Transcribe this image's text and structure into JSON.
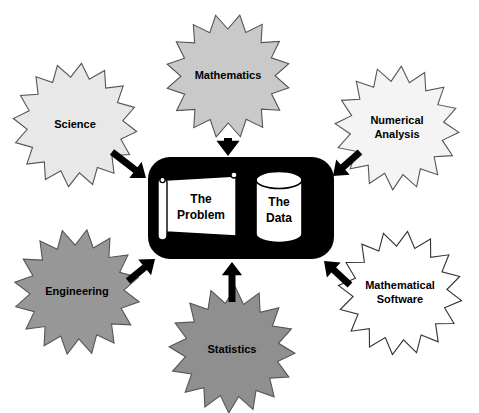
{
  "diagram": {
    "type": "hub-and-spoke",
    "canvas": {
      "width": 479,
      "height": 413,
      "background": "#ffffff"
    },
    "core": {
      "name": "central-container",
      "shape": "rounded-rectangle",
      "fill": "#000000",
      "x": 148,
      "y": 157,
      "width": 186,
      "height": 102,
      "radius": 22,
      "nodes": [
        {
          "id": "problem",
          "label_lines": [
            "The",
            "Problem"
          ],
          "shape": "scroll-banner",
          "fill": "#ffffff",
          "stroke": "#000000"
        },
        {
          "id": "data",
          "label_lines": [
            "The",
            "Data"
          ],
          "shape": "cylinder",
          "fill": "#ffffff",
          "stroke": "#000000"
        }
      ]
    },
    "bursts": [
      {
        "id": "science",
        "label_lines": [
          "Science"
        ],
        "fill": "#e8e8e8",
        "stroke": "#555555",
        "cx": 75,
        "cy": 125,
        "r_outer": 62,
        "r_inner": 48,
        "points": 16,
        "rotation": 6
      },
      {
        "id": "mathematics",
        "label_lines": [
          "Mathematics"
        ],
        "fill": "#c9c9c9",
        "stroke": "#555555",
        "cx": 228,
        "cy": 76,
        "r_outer": 62,
        "r_inner": 47,
        "points": 16,
        "rotation": 11
      },
      {
        "id": "numerical-analysis",
        "label_lines": [
          "Numerical",
          "Analysis"
        ],
        "fill": "#f4f4f4",
        "stroke": "#555555",
        "cx": 397,
        "cy": 128,
        "r_outer": 62,
        "r_inner": 47,
        "points": 16,
        "rotation": 4
      },
      {
        "id": "engineering",
        "label_lines": [
          "Engineering"
        ],
        "fill": "#979797",
        "stroke": "#555555",
        "cx": 77,
        "cy": 292,
        "r_outer": 63,
        "r_inner": 47,
        "points": 16,
        "rotation": 9
      },
      {
        "id": "statistics",
        "label_lines": [
          "Statistics"
        ],
        "fill": "#8f8f8f",
        "stroke": "#555555",
        "cx": 232,
        "cy": 350,
        "r_outer": 63,
        "r_inner": 47,
        "points": 16,
        "rotation": 3
      },
      {
        "id": "mathematical-software",
        "label_lines": [
          "Mathematical",
          "Software"
        ],
        "fill": "#ffffff",
        "stroke": "#333333",
        "cx": 400,
        "cy": 293,
        "r_outer": 62,
        "r_inner": 47,
        "points": 16,
        "rotation": 7
      }
    ],
    "arrows": [
      {
        "id": "science-to-core",
        "from": "science",
        "to": "core",
        "x1": 112,
        "y1": 152,
        "x2": 146,
        "y2": 178,
        "width": 7
      },
      {
        "id": "mathematics-to-core",
        "from": "mathematics",
        "to": "core",
        "x1": 228,
        "y1": 138,
        "x2": 228,
        "y2": 156,
        "width": 8
      },
      {
        "id": "numerical-analysis-to-core",
        "from": "numerical-analysis",
        "to": "core",
        "x1": 360,
        "y1": 152,
        "x2": 333,
        "y2": 176,
        "width": 7
      },
      {
        "id": "engineering-to-core",
        "from": "engineering",
        "to": "core",
        "x1": 128,
        "y1": 281,
        "x2": 155,
        "y2": 259,
        "width": 7
      },
      {
        "id": "statistics-to-core",
        "from": "statistics",
        "to": "core",
        "x1": 232,
        "y1": 302,
        "x2": 232,
        "y2": 262,
        "width": 7
      },
      {
        "id": "mathematical-software-to-core",
        "from": "mathematical-software",
        "to": "core",
        "x1": 350,
        "y1": 285,
        "x2": 324,
        "y2": 261,
        "width": 7
      }
    ]
  }
}
